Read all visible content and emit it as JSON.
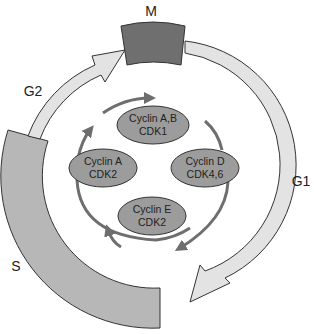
{
  "phases": {
    "m": "M",
    "g1": "G1",
    "s": "S",
    "g2": "G2"
  },
  "complexes": [
    {
      "cyclin": "Cyclin A,B",
      "cdk": "CDK1"
    },
    {
      "cyclin": "Cyclin D",
      "cdk": "CDK4,6"
    },
    {
      "cyclin": "Cyclin E",
      "cdk": "CDK2"
    },
    {
      "cyclin": "Cyclin A",
      "cdk": "CDK2"
    }
  ],
  "colors": {
    "ring": "#e3e3e3",
    "s_block": "#b7b7b7",
    "m_block": "#6f6f6f",
    "ellipse": "#9c9c9c",
    "inner_arrow": "#6e6e6e",
    "outline": "#333333"
  }
}
